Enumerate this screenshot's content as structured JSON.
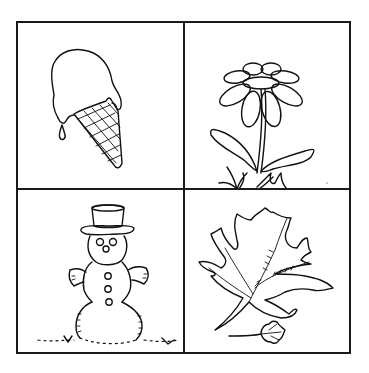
{
  "worksheet": {
    "layout": "2x2 grid",
    "panels": [
      {
        "position": "top-left",
        "subject": "melting ice cream cone",
        "season": "summer"
      },
      {
        "position": "top-right",
        "subject": "daisy flower with leaves and grass",
        "season": "spring"
      },
      {
        "position": "bottom-left",
        "subject": "snowman with top hat",
        "season": "winter"
      },
      {
        "position": "bottom-right",
        "subject": "oak leaf and small maple leaf",
        "season": "autumn"
      }
    ]
  }
}
